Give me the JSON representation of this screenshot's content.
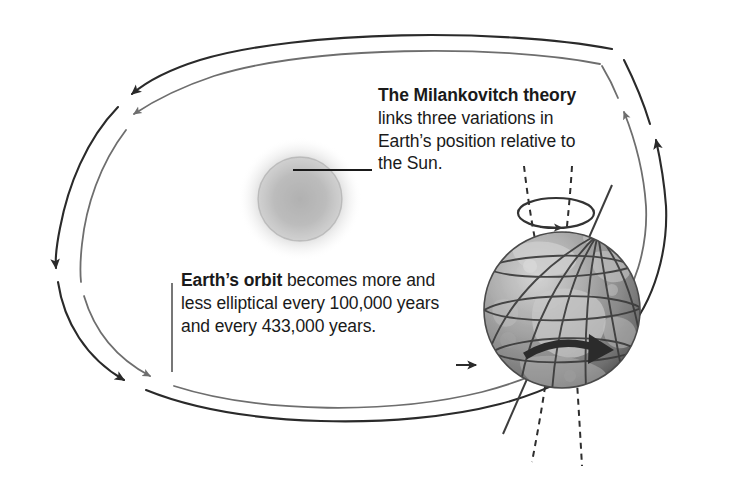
{
  "figure": {
    "width": 741,
    "height": 479,
    "background": "#ffffff"
  },
  "callouts": {
    "theory": {
      "lead": "The Milankovitch theory",
      "body": " links three variations in Earth’s position relative to the Sun.",
      "lead_bold": true
    },
    "orbit": {
      "lead": "Earth’s orbit",
      "body": " becomes more and less elliptical every 100,000 years and every 433,000 years.",
      "lead_bold": true
    }
  },
  "values": {
    "eccentricity_cycle_1": "100,000 years",
    "eccentricity_cycle_2": "433,000 years"
  },
  "objects": {
    "sun": {
      "name": "Sun",
      "style": "soft blurred gray sphere",
      "color": "#b9b9b9",
      "cx": 300,
      "cy": 199,
      "r": 46
    },
    "earth": {
      "name": "Earth",
      "style": "grayscale textured globe with latitude and longitude grid",
      "color": "#8d8d8d",
      "cx": 562,
      "cy": 310,
      "r": 78
    },
    "precession_circle": {
      "name": "axial precession circle",
      "color": "#333333"
    },
    "rotation_arrow": {
      "name": "Earth rotation arrow",
      "color": "#2b2b2b"
    },
    "tilt_axis": {
      "name": "Earth tilted rotational axis",
      "color": "#444444"
    },
    "tilt_variation_axes": {
      "name": "dashed obliquity variation axes",
      "color": "#2e2e2e",
      "style": "dashed",
      "count": 2
    }
  },
  "orbits": [
    {
      "name": "outer-elliptical-orbit",
      "color": "#2a2a2a",
      "direction": "counterclockwise",
      "arrowheads": 4
    },
    {
      "name": "inner-elliptical-orbit",
      "color": "#6e6e6e",
      "direction": "counterclockwise",
      "arrowheads": 3
    }
  ],
  "leaders": {
    "sun_leader": {
      "name": "sun-leader-line",
      "color": "#1a1a1a"
    },
    "orbit_leader": {
      "name": "orbit-leader-line",
      "color": "#555555"
    }
  },
  "colors": {
    "text": "#1a1a1a",
    "orbit_dark": "#2a2a2a",
    "orbit_light": "#6e6e6e",
    "sun": "#b9b9b9",
    "earth": "#8d8d8d",
    "background": "#ffffff"
  }
}
